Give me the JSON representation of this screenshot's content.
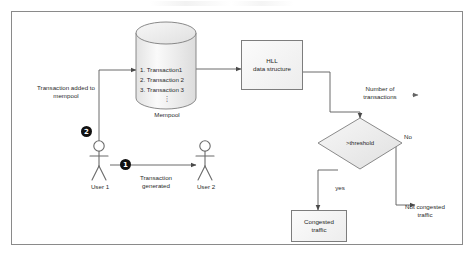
{
  "diagram": {
    "frame_border_color": "#8a8a8a",
    "accent_color": "#111111",
    "node_fill": "#efefef"
  },
  "nodes": {
    "mempool": {
      "caption": "Mempool",
      "items": [
        "1. Transaction1",
        "2. Transaction 2",
        "3. Transaction 3"
      ],
      "ellipsis": "⋮"
    },
    "hll": {
      "label": "HLL\ndata structure"
    },
    "decision": {
      "label": ">threshold"
    },
    "congested": {
      "label": "Congested\ntraffic"
    },
    "user1": {
      "label": "User 1"
    },
    "user2": {
      "label": "User 2"
    }
  },
  "labels": {
    "added_to_mempool": "Transaction added to\nmempool",
    "transaction_generated": "Transaction\ngenerated",
    "number_of_transactions": "Number of\ntransactions",
    "not_congested": "Not congested\ntraffic"
  },
  "edges": {
    "yes": "yes",
    "no": "No"
  },
  "badges": {
    "one": "❶",
    "two": "❷",
    "one_num": "1",
    "two_num": "2"
  }
}
